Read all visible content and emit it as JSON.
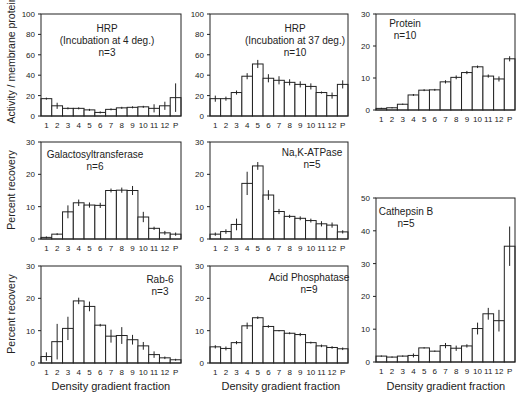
{
  "figure": {
    "ylabels": [
      {
        "text": "Activity / membrane protein",
        "cx": 10,
        "cy": 60
      },
      {
        "text": "Percent recovery",
        "cx": 10,
        "cy": 190
      },
      {
        "text": "Percent recovery",
        "cx": 10,
        "cy": 314
      }
    ],
    "xlabels": [
      {
        "text": "Density gradient fraction",
        "cx": 111,
        "cy": 386
      },
      {
        "text": "Density gradient fraction",
        "cx": 281,
        "cy": 386
      },
      {
        "text": "Density gradient fraction",
        "cx": 446,
        "cy": 386
      }
    ]
  },
  "chart_data": [
    {
      "type": "bar",
      "title": "HRP",
      "subtitle": "(Incubation at 4 deg.)",
      "n": "n=3",
      "categories": [
        "1",
        "2",
        "3",
        "4",
        "5",
        "6",
        "7",
        "8",
        "9",
        "10",
        "11",
        "12",
        "P"
      ],
      "values": [
        17,
        10,
        7.5,
        7.5,
        6,
        3.5,
        6.5,
        8,
        8.5,
        9,
        7.5,
        10,
        18
      ],
      "errors": [
        1,
        3,
        1,
        1,
        1,
        1,
        1,
        1,
        1,
        1,
        4,
        4,
        14
      ],
      "ylim": [
        0,
        100
      ],
      "yticks": [
        0,
        20,
        40,
        60,
        80,
        100
      ],
      "ylabel": "Activity / membrane protein",
      "xlabel": "",
      "box": {
        "x": 41,
        "y": 14,
        "w": 140,
        "h": 102
      },
      "label_pos": {
        "x": 107,
        "y": 32
      }
    },
    {
      "type": "bar",
      "title": "HRP",
      "subtitle": "(Incubation at 37 deg.)",
      "n": "n=10",
      "categories": [
        "1",
        "2",
        "3",
        "4",
        "5",
        "6",
        "7",
        "8",
        "9",
        "10",
        "11",
        "12",
        "P"
      ],
      "values": [
        17,
        17,
        23,
        39,
        51,
        37,
        35,
        33,
        31,
        29,
        23,
        20,
        31
      ],
      "errors": [
        3,
        2,
        2,
        3,
        4,
        4,
        4,
        3,
        3,
        3,
        1,
        3,
        4
      ],
      "ylim": [
        0,
        100
      ],
      "yticks": [
        0,
        20,
        40,
        60,
        80,
        100
      ],
      "ylabel": "",
      "xlabel": "",
      "box": {
        "x": 210,
        "y": 14,
        "w": 138,
        "h": 102
      },
      "label_pos": {
        "x": 295,
        "y": 32
      }
    },
    {
      "type": "bar",
      "title": "Protein",
      "subtitle": "",
      "n": "n=10",
      "categories": [
        "1",
        "2",
        "3",
        "4",
        "5",
        "6",
        "7",
        "8",
        "9",
        "10",
        "11",
        "12",
        "P"
      ],
      "values": [
        0.5,
        0.7,
        1.8,
        4.7,
        6.2,
        6.3,
        8.8,
        10.2,
        11.7,
        13.5,
        10.6,
        9.7,
        16
      ],
      "errors": [
        0.2,
        0.2,
        0.2,
        0.3,
        0.3,
        0.3,
        0.5,
        0.6,
        0.5,
        0.4,
        0.5,
        0.8,
        0.8
      ],
      "ylim": [
        0,
        30
      ],
      "yticks": [
        0,
        10,
        20,
        30
      ],
      "ylabel": "",
      "xlabel": "",
      "box": {
        "x": 376,
        "y": 14,
        "w": 139,
        "h": 96
      },
      "label_pos": {
        "x": 405,
        "y": 27
      }
    },
    {
      "type": "bar",
      "title": "Galactosyltransferase",
      "subtitle": "",
      "n": "n=6",
      "categories": [
        "1",
        "2",
        "3",
        "4",
        "5",
        "6",
        "7",
        "8",
        "9",
        "10",
        "11",
        "12",
        "P"
      ],
      "values": [
        0.5,
        1.5,
        8.4,
        11.2,
        10.5,
        10.4,
        15,
        15.1,
        15,
        6.8,
        3.3,
        1.9,
        1.5
      ],
      "errors": [
        0.3,
        0.3,
        2,
        1,
        0.8,
        0.8,
        0.6,
        0.8,
        1.4,
        1.6,
        0.5,
        0.6,
        0.5
      ],
      "ylim": [
        0,
        30
      ],
      "yticks": [
        0,
        10,
        20,
        30
      ],
      "ylabel": "Percent recovery",
      "xlabel": "",
      "box": {
        "x": 41,
        "y": 142,
        "w": 140,
        "h": 97
      },
      "label_pos": {
        "x": 95,
        "y": 158
      }
    },
    {
      "type": "bar",
      "title": "Na,K-ATPase",
      "subtitle": "",
      "n": "n=5",
      "categories": [
        "1",
        "2",
        "3",
        "4",
        "5",
        "6",
        "7",
        "8",
        "9",
        "10",
        "11",
        "12",
        "P"
      ],
      "values": [
        1.5,
        2.3,
        4.5,
        17.2,
        22.6,
        13.6,
        8.5,
        7,
        6.4,
        5.7,
        4.7,
        4.3,
        2.2
      ],
      "errors": [
        0.5,
        0.7,
        1.8,
        3.6,
        1.2,
        1.5,
        0.8,
        0.5,
        0.6,
        0.6,
        0.8,
        0.8,
        0.5
      ],
      "ylim": [
        0,
        30
      ],
      "yticks": [
        0,
        10,
        20,
        30
      ],
      "ylabel": "",
      "xlabel": "",
      "box": {
        "x": 210,
        "y": 142,
        "w": 138,
        "h": 97
      },
      "label_pos": {
        "x": 312,
        "y": 156
      }
    },
    {
      "type": "bar",
      "title": "Rab-6",
      "subtitle": "",
      "n": "n=3",
      "categories": [
        "1",
        "2",
        "3",
        "4",
        "5",
        "6",
        "7",
        "8",
        "9",
        "10",
        "11",
        "12",
        "P"
      ],
      "values": [
        2,
        6.6,
        10.7,
        19.2,
        17.5,
        11.7,
        8.3,
        8.5,
        7.2,
        5.3,
        2.6,
        1.6,
        1
      ],
      "errors": [
        1.3,
        5.5,
        3.6,
        1,
        1.5,
        0.4,
        2,
        2.6,
        1.5,
        1.2,
        1,
        0.4,
        0.3
      ],
      "ylim": [
        0,
        30
      ],
      "yticks": [
        0,
        10,
        20,
        30
      ],
      "ylabel": "Percent recovery",
      "xlabel": "Density gradient fraction",
      "box": {
        "x": 41,
        "y": 266,
        "w": 140,
        "h": 97
      },
      "label_pos": {
        "x": 160,
        "y": 283
      }
    },
    {
      "type": "bar",
      "title": "Acid Phosphatase",
      "subtitle": "",
      "n": "n=9",
      "categories": [
        "1",
        "2",
        "3",
        "4",
        "5",
        "6",
        "7",
        "8",
        "9",
        "10",
        "11",
        "12",
        "P"
      ],
      "values": [
        5,
        4.5,
        6.3,
        11.5,
        14,
        11.3,
        10,
        9.2,
        8.8,
        6.3,
        5.3,
        4.8,
        4.4
      ],
      "errors": [
        0.5,
        0.6,
        0.5,
        1,
        0.4,
        0.4,
        0.2,
        0.3,
        0.5,
        0.3,
        0.4,
        0.4,
        0.4
      ],
      "ylim": [
        0,
        30
      ],
      "yticks": [
        0,
        10,
        20,
        30
      ],
      "ylabel": "",
      "xlabel": "Density gradient fraction",
      "box": {
        "x": 210,
        "y": 266,
        "w": 138,
        "h": 97
      },
      "label_pos": {
        "x": 309,
        "y": 281
      }
    },
    {
      "type": "bar",
      "title": "Cathepsin B",
      "subtitle": "",
      "n": "n=5",
      "categories": [
        "1",
        "2",
        "3",
        "4",
        "5",
        "6",
        "7",
        "8",
        "9",
        "10",
        "11",
        "12",
        "P"
      ],
      "values": [
        1.8,
        1.5,
        1.8,
        2,
        4.3,
        3.3,
        5,
        4.2,
        4.9,
        10.2,
        14.7,
        12.6,
        35.3
      ],
      "errors": [
        0.2,
        0.2,
        0.2,
        0.6,
        0.2,
        0.2,
        0.8,
        0.8,
        0.5,
        1.8,
        1.8,
        3.3,
        6
      ],
      "ylim": [
        0,
        50
      ],
      "yticks": [
        0,
        10,
        20,
        30,
        40,
        50
      ],
      "ylabel": "",
      "xlabel": "Density gradient fraction",
      "box": {
        "x": 376,
        "y": 198,
        "w": 139,
        "h": 164
      },
      "label_pos": {
        "x": 406,
        "y": 215
      }
    }
  ]
}
